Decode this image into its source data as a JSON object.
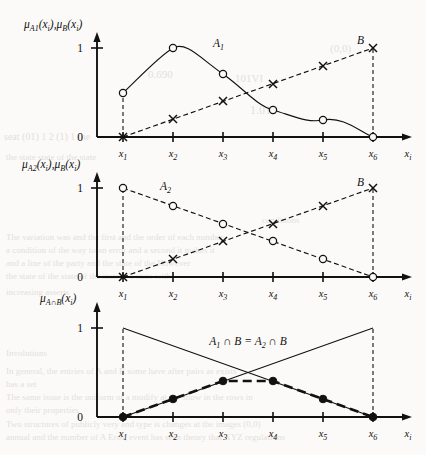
{
  "figure": {
    "background_text": [
      {
        "text": "(0,0)",
        "x": 330,
        "y": 42,
        "size": 11
      },
      {
        "text": "0.690",
        "x": 148,
        "y": 68,
        "size": 11
      },
      {
        "text": "101VI",
        "x": 235,
        "y": 72,
        "size": 11
      },
      {
        "text": "1.010",
        "x": 250,
        "y": 103,
        "size": 12
      },
      {
        "text": "seat (01) 1 2 (1) 1 the",
        "x": 4,
        "y": 131,
        "size": 10
      },
      {
        "text": "the state state of the state",
        "x": 6,
        "y": 152,
        "size": 9
      },
      {
        "text": "conditions",
        "x": 262,
        "y": 215,
        "size": 9
      },
      {
        "text": "The variation was and the first and the order of each number",
        "x": 6,
        "y": 232,
        "size": 9
      },
      {
        "text": "a condition of the way to an error and a second it makes it",
        "x": 6,
        "y": 245,
        "size": 9
      },
      {
        "text": "and a line of the party and the state of the However",
        "x": 6,
        "y": 258,
        "size": 9
      },
      {
        "text": "the state of the state of the state is a state with",
        "x": 6,
        "y": 271,
        "size": 9
      },
      {
        "text": "increasing asserts",
        "x": 6,
        "y": 287,
        "size": 9
      },
      {
        "text": "Involutions",
        "x": 6,
        "y": 348,
        "size": 9
      },
      {
        "text": "In general, the entries of A and B some have after pairs as exists",
        "x": 6,
        "y": 366,
        "size": 9
      },
      {
        "text": "has a set",
        "x": 6,
        "y": 379,
        "size": 9
      },
      {
        "text": "The same issue is the uniform of a modify at the show in the rows in",
        "x": 6,
        "y": 392,
        "size": 9
      },
      {
        "text": "only their properties",
        "x": 6,
        "y": 405,
        "size": 9
      },
      {
        "text": "Two structures of publicly very and type is changes at the images (0,0)",
        "x": 6,
        "y": 419,
        "size": 9
      },
      {
        "text": "annual and the number of A Eros, event has seen theory that XYZ regulations",
        "x": 6,
        "y": 432,
        "size": 9
      }
    ],
    "panels": [
      {
        "id": "panel-1",
        "ylabel": "μ",
        "ylabel_full": "μA1(xi),μB(xi)",
        "ylabel_parts": {
          "mu1": "μ",
          "sub1": "A1",
          "arg1": "(x",
          "argsub1": "i",
          "argend1": ")",
          "comma": ",",
          "mu2": "μ",
          "sub2": "B",
          "arg2": "(x",
          "argsub2": "i",
          "argend2": ")"
        },
        "ytick_top": "1",
        "ytick_bottom": "0",
        "xlabel": "x",
        "xlabel_sub": "i",
        "xticks": [
          "x1",
          "x2",
          "x3",
          "x4",
          "x5",
          "x6"
        ],
        "xtick_base": "x",
        "xtick_subs": [
          "1",
          "2",
          "3",
          "4",
          "5",
          "6"
        ],
        "curve_labels": [
          {
            "name": "A1",
            "base": "A",
            "sub": "1",
            "x": 213,
            "y": 47
          },
          {
            "name": "B",
            "base": "B",
            "sub": "",
            "x": 357,
            "y": 44
          }
        ]
      },
      {
        "id": "panel-2",
        "ylabel_parts": {
          "mu1": "μ",
          "sub1": "A2",
          "arg1": "(x",
          "argsub1": "i",
          "argend1": ")",
          "comma": ",",
          "mu2": "μ",
          "sub2": "B",
          "arg2": "(x",
          "argsub2": "i",
          "argend2": ")"
        },
        "ytick_top": "1",
        "ytick_bottom": "0",
        "xlabel": "x",
        "xlabel_sub": "i",
        "xtick_base": "x",
        "xtick_subs": [
          "1",
          "2",
          "3",
          "4",
          "5",
          "6"
        ],
        "curve_labels": [
          {
            "name": "A2",
            "base": "A",
            "sub": "2",
            "x": 160,
            "y": 190
          },
          {
            "name": "B",
            "base": "B",
            "sub": "",
            "x": 357,
            "y": 188
          }
        ]
      },
      {
        "id": "panel-3",
        "ylabel_parts": {
          "mu1": "μ",
          "sub1": "A∩B",
          "arg1": "(x",
          "argsub1": "i",
          "argend1": ")",
          "comma": "",
          "mu2": "",
          "sub2": "",
          "arg2": "",
          "argsub2": "",
          "argend2": ""
        },
        "ytick_top": "1",
        "ytick_bottom": "0",
        "xlabel": "x",
        "xlabel_sub": "i",
        "xtick_base": "x",
        "xtick_subs": [
          "1",
          "2",
          "3",
          "4",
          "5",
          "6"
        ],
        "intersection_label": "A1 ∩ B = A2 ∩ B",
        "intersection_parts": {
          "a1": "A",
          "a1s": "1",
          "cap1": "∩",
          "b1": "B",
          "eq": "=",
          "a2": "A",
          "a2s": "2",
          "cap2": "∩",
          "b2": "B"
        }
      }
    ]
  },
  "chart_data": [
    {
      "type": "line",
      "id": "panel-1",
      "title": "",
      "xlabel": "x_i",
      "ylabel": "mu_A1(x_i), mu_B(x_i)",
      "categories": [
        "x1",
        "x2",
        "x3",
        "x4",
        "x5",
        "x6"
      ],
      "ylim": [
        0,
        1
      ],
      "xlim_labels": [
        "x1",
        "x6"
      ],
      "grid": false,
      "legend": "inline-annotations",
      "series": [
        {
          "name": "A1",
          "marker": "open-circle",
          "linestyle": "solid-smooth",
          "values": [
            0.5,
            1.0,
            0.7,
            0.4,
            0.2,
            0.0
          ]
        },
        {
          "name": "B",
          "marker": "x",
          "linestyle": "dashed",
          "values": [
            0.0,
            0.2,
            0.4,
            0.6,
            0.8,
            1.0
          ]
        }
      ]
    },
    {
      "type": "line",
      "id": "panel-2",
      "title": "",
      "xlabel": "x_i",
      "ylabel": "mu_A2(x_i), mu_B(x_i)",
      "categories": [
        "x1",
        "x2",
        "x3",
        "x4",
        "x5",
        "x6"
      ],
      "ylim": [
        0,
        1
      ],
      "grid": false,
      "legend": "inline-annotations",
      "series": [
        {
          "name": "A2",
          "marker": "open-circle",
          "linestyle": "dashed",
          "values": [
            1.0,
            0.8,
            0.6,
            0.4,
            0.2,
            0.0
          ]
        },
        {
          "name": "B",
          "marker": "x",
          "linestyle": "dashed",
          "values": [
            0.0,
            0.2,
            0.4,
            0.6,
            0.8,
            1.0
          ]
        }
      ]
    },
    {
      "type": "line",
      "id": "panel-3",
      "title": "A1 ∩ B = A2 ∩ B",
      "xlabel": "x_i",
      "ylabel": "mu_A∩B(x_i)",
      "categories": [
        "x1",
        "x2",
        "x3",
        "x4",
        "x5",
        "x6"
      ],
      "ylim": [
        0,
        1
      ],
      "grid": false,
      "legend": "inline-annotation",
      "series": [
        {
          "name": "A ∩ B (min)",
          "marker": "filled-circle",
          "linestyle": "heavy-dashed",
          "values": [
            0.0,
            0.2,
            0.4,
            0.4,
            0.2,
            0.0
          ]
        },
        {
          "name": "A2 reference",
          "marker": "none",
          "linestyle": "thin-solid",
          "values": [
            1.0,
            0.8,
            0.6,
            0.4,
            0.2,
            0.0
          ]
        },
        {
          "name": "B reference",
          "marker": "none",
          "linestyle": "thin-solid",
          "values": [
            0.0,
            0.2,
            0.4,
            0.6,
            0.8,
            1.0
          ]
        }
      ]
    }
  ]
}
